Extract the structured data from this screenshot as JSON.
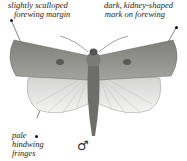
{
  "annotations": {
    "top_left": [
      "slightly scalloped",
      "forewing margin"
    ],
    "top_right": [
      "dark, kidney-shaped",
      "mark on forewing"
    ],
    "bottom_left": [
      "pale",
      "hindwing",
      "fringes"
    ]
  },
  "sex_symbol": "♂",
  "colors": {
    "forewing": "#8a8a86",
    "hindwing": "#e6e6e4",
    "body": "#6d6d6a",
    "text": "#222222"
  }
}
